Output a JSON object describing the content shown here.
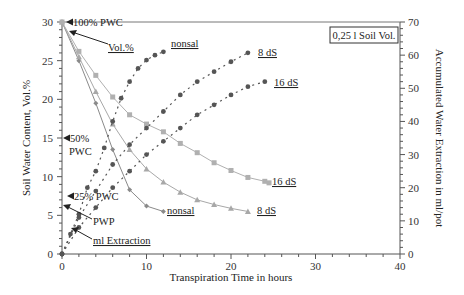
{
  "chart_data": {
    "type": "line",
    "title": "",
    "xlabel": "Transpiration Time in hours",
    "ylabel": "Soil Water Content, Vol.%",
    "y2label": "Accumulated Water Extraction in ml/pot",
    "xlim": [
      0,
      40
    ],
    "ylim": [
      0,
      30
    ],
    "y2lim": [
      0,
      70
    ],
    "x_ticks": [
      "0",
      "10",
      "20",
      "30",
      "40"
    ],
    "y_ticks": [
      "0",
      "5",
      "10",
      "15",
      "20",
      "25",
      "30"
    ],
    "y2_ticks": [
      "0",
      "10",
      "20",
      "30",
      "40",
      "50",
      "60",
      "70"
    ],
    "grid": false,
    "legend": "none (inline labels)",
    "box_label": "0,25 l Soil Vol.",
    "annotations": {
      "pwc100": "100% PWC",
      "vol": "Vol.%",
      "pwc50_line1": "50%",
      "pwc50_line2": "PWC",
      "pwc25": "25% PWC",
      "pwp": "PWP",
      "ml_extraction": "ml Extraction"
    },
    "series": [
      {
        "name": "nonsal (Vol.%)",
        "axis": "left",
        "marker": "diamond",
        "color": "#8a8a8a",
        "x": [
          0,
          2,
          4,
          6,
          8,
          10,
          12
        ],
        "values": [
          30,
          25,
          19.5,
          13.5,
          8.3,
          6.2,
          5.5
        ]
      },
      {
        "name": "8 dS (Vol.%)",
        "axis": "left",
        "marker": "triangle",
        "color": "#a8a8a8",
        "x": [
          0,
          2,
          4,
          6,
          8,
          10,
          12,
          14,
          16,
          18,
          20,
          22
        ],
        "values": [
          30,
          25.5,
          21,
          16.8,
          13.5,
          11,
          9.3,
          8.0,
          7.0,
          6.4,
          5.9,
          5.5
        ]
      },
      {
        "name": "16 dS (Vol.%)",
        "axis": "left",
        "marker": "square",
        "color": "#b0b0b0",
        "x": [
          0,
          2,
          4,
          6,
          8,
          10,
          12,
          14,
          16,
          18,
          20,
          22,
          24,
          24.5
        ],
        "values": [
          30,
          26.2,
          23.1,
          20.3,
          18.0,
          16.8,
          15.8,
          14.3,
          13.1,
          11.8,
          10.8,
          9.9,
          9.4,
          9.2
        ]
      },
      {
        "name": "nonsal (ml)",
        "axis": "right",
        "marker": "circle",
        "color": "#555555",
        "x": [
          0,
          1,
          2,
          3,
          4,
          5,
          6,
          7,
          8,
          9,
          10,
          11,
          12
        ],
        "values": [
          0,
          6,
          12,
          20,
          25,
          32,
          40,
          47,
          52,
          56,
          58.5,
          60,
          61
        ]
      },
      {
        "name": "8 dS (ml)",
        "axis": "right",
        "marker": "circle",
        "color": "#555555",
        "x": [
          0,
          2,
          4,
          6,
          8,
          10,
          12,
          14,
          16,
          18,
          20,
          22
        ],
        "values": [
          0,
          11,
          19,
          27,
          33,
          38,
          43,
          48,
          52,
          55,
          58,
          60.7
        ]
      },
      {
        "name": "16 dS (ml)",
        "axis": "right",
        "marker": "circle",
        "color": "#555555",
        "x": [
          0,
          2,
          4,
          6,
          8,
          10,
          12,
          14,
          16,
          18,
          20,
          22,
          24
        ],
        "values": [
          0,
          8,
          14,
          20,
          25,
          30,
          34,
          38,
          42,
          45,
          48,
          50.5,
          52
        ]
      }
    ],
    "series_labels": {
      "nonsal_ml": "nonsal",
      "dS8_ml": "8 dS",
      "dS16_ml": "16 dS",
      "nonsal_vol": "nonsal",
      "dS8_vol": "8 dS",
      "dS16_vol": "16 dS"
    }
  }
}
